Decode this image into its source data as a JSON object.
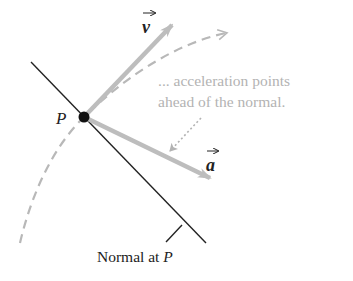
{
  "diagram": {
    "point": {
      "label": "P"
    },
    "vectors": {
      "velocity": {
        "label": "v",
        "symbol": "vector-arrow"
      },
      "acceleration": {
        "label": "a",
        "symbol": "vector-arrow"
      }
    },
    "annotation": {
      "line1": "... acceleration points",
      "line2": "ahead of the normal."
    },
    "normal": {
      "caption_prefix": "Normal at ",
      "caption_point": "P"
    },
    "colors": {
      "line": "#222222",
      "vector": "#bdbdbd",
      "path": "#b8b8b8",
      "annotation": "#b3b3b3",
      "point": "#111111"
    }
  }
}
